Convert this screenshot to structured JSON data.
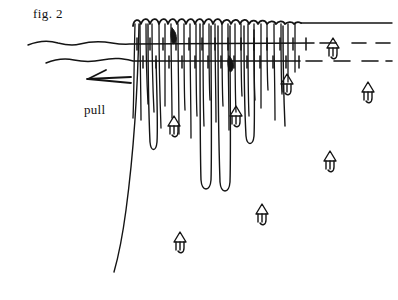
{
  "figure": {
    "caption": "fig. 2",
    "pull_label": "pull",
    "ink_color": "#141414",
    "background_color": "#ffffff",
    "width": 398,
    "height": 300
  },
  "annotations": {
    "direction_arrow": {
      "name": "pull-arrow",
      "direction": "left",
      "x1": 130,
      "y1": 79,
      "x2": 86,
      "y2": 79
    }
  },
  "lines": {
    "upper_line": {
      "label": "upper-horizontal-line",
      "y": 44,
      "x_start": 28,
      "x_solid_end": 314,
      "x_dashed_end": 390,
      "style": "solid-then-dashed"
    },
    "lower_line": {
      "label": "lower-horizontal-line",
      "y": 62,
      "x_start": 46,
      "x_solid_end": 300,
      "x_dashed_end": 390,
      "style": "solid-then-dashed"
    }
  },
  "fringe": {
    "label": "fringed-fabric-edge",
    "top_edge_y": 20,
    "left_x": 133,
    "right_x": 300,
    "scallop_count": 17
  },
  "flow_markers": [
    {
      "id": "marker-1",
      "x": 174,
      "y": 122,
      "glyph": "up-arrow"
    },
    {
      "id": "marker-2",
      "x": 236,
      "y": 112,
      "glyph": "up-arrow"
    },
    {
      "id": "marker-3",
      "x": 287,
      "y": 80,
      "glyph": "up-arrow"
    },
    {
      "id": "marker-4",
      "x": 333,
      "y": 44,
      "glyph": "up-arrow"
    },
    {
      "id": "marker-5",
      "x": 368,
      "y": 88,
      "glyph": "up-arrow"
    },
    {
      "id": "marker-6",
      "x": 330,
      "y": 157,
      "glyph": "up-arrow"
    },
    {
      "id": "marker-7",
      "x": 262,
      "y": 210,
      "glyph": "up-arrow"
    },
    {
      "id": "marker-8",
      "x": 180,
      "y": 238,
      "glyph": "up-arrow"
    }
  ],
  "dark_markers": [
    {
      "id": "dark-marker-1",
      "x": 175,
      "y": 33
    },
    {
      "id": "dark-marker-2",
      "x": 232,
      "y": 62
    }
  ]
}
